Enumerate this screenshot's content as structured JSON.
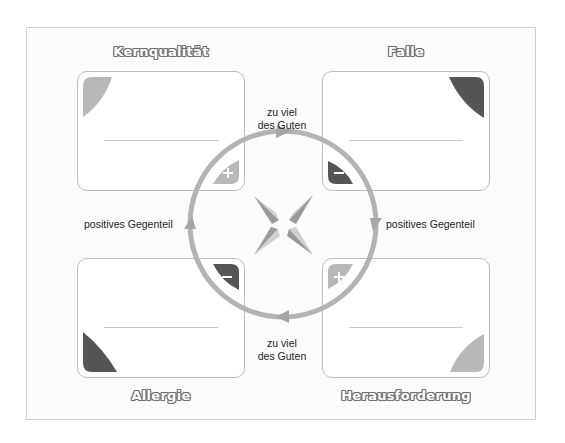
{
  "quadrants": {
    "top_left": {
      "title": "Kernqualität",
      "badge": "+",
      "corner_color": "#b8b8b8",
      "badge_color": "#b8b8b8"
    },
    "top_right": {
      "title": "Falle",
      "badge": "−",
      "corner_color": "#555555",
      "badge_color": "#555555"
    },
    "bottom_left": {
      "title": "Allergie",
      "badge": "−",
      "corner_color": "#555555",
      "badge_color": "#555555"
    },
    "bottom_right": {
      "title": "Herausforderung",
      "badge": "+",
      "corner_color": "#b8b8b8",
      "badge_color": "#b8b8b8"
    }
  },
  "connectors": {
    "top": "zu viel\ndes Guten",
    "top_line1": "zu viel",
    "top_line2": "des Guten",
    "bottom_line1": "zu viel",
    "bottom_line2": "des Guten",
    "left": "positives Gegenteil",
    "right": "positives Gegenteil"
  },
  "colors": {
    "circle": "#b3b3b3",
    "box_border": "#bdbdbd",
    "dark": "#555555",
    "light": "#b8b8b8"
  }
}
